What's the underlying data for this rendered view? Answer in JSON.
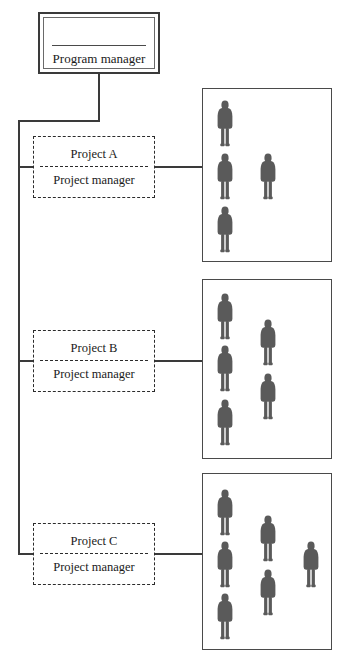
{
  "diagram": {
    "type": "organizational-chart",
    "program": {
      "label": "Program manager"
    },
    "projects": [
      {
        "id": "project-a",
        "title": "Project A",
        "role": "Project manager",
        "team_size": 4,
        "team_members": [
          {
            "column": 1,
            "row": 1
          },
          {
            "column": 1,
            "row": 2
          },
          {
            "column": 1,
            "row": 3
          },
          {
            "column": 2,
            "row": 2
          }
        ]
      },
      {
        "id": "project-b",
        "title": "Project B",
        "role": "Project manager",
        "team_size": 5,
        "team_members": [
          {
            "column": 1,
            "row": 1
          },
          {
            "column": 1,
            "row": 2
          },
          {
            "column": 1,
            "row": 3
          },
          {
            "column": 2,
            "row": 1
          },
          {
            "column": 2,
            "row": 2
          }
        ]
      },
      {
        "id": "project-c",
        "title": "Project C",
        "role": "Project manager",
        "team_size": 6,
        "team_members": [
          {
            "column": 1,
            "row": 1
          },
          {
            "column": 1,
            "row": 2
          },
          {
            "column": 1,
            "row": 3
          },
          {
            "column": 2,
            "row": 1
          },
          {
            "column": 2,
            "row": 2
          },
          {
            "column": 3,
            "row": 2
          }
        ]
      }
    ],
    "colors": {
      "line": "#3a3a3a",
      "box_border": "#4a4a4a",
      "dashed_border": "#2b2b2b",
      "person_fill": "#5a5a5a",
      "background": "#ffffff",
      "text": "#1a1a1a"
    }
  }
}
